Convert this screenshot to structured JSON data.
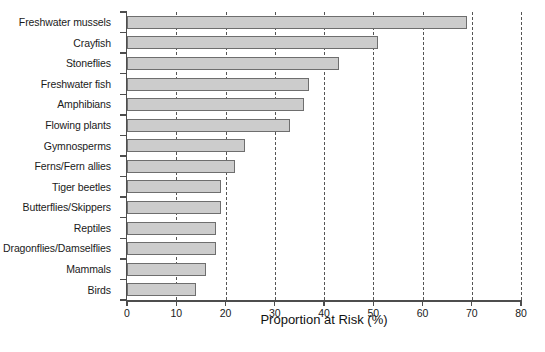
{
  "chart_data": {
    "type": "bar",
    "orientation": "horizontal",
    "title": "",
    "xlabel": "Proportion at Risk (%)",
    "ylabel": "",
    "xlim": [
      0,
      80
    ],
    "xticks": [
      0,
      10,
      20,
      30,
      40,
      50,
      60,
      70,
      80
    ],
    "xtick_labels": [
      "0",
      "10",
      "20",
      "30",
      "40",
      "50",
      "60",
      "70",
      "80"
    ],
    "grid": "vertical-dashed",
    "legend": "none",
    "categories": [
      "Freshwater mussels",
      "Crayfish",
      "Stoneflies",
      "Freshwater fish",
      "Amphibians",
      "Flowing plants",
      "Gymnosperms",
      "Ferns/Fern allies",
      "Tiger beetles",
      "Butterflies/Skippers",
      "Reptiles",
      "Dragonflies/Damselflies",
      "Mammals",
      "Birds"
    ],
    "values": [
      69,
      51,
      43,
      37,
      36,
      33,
      24,
      22,
      19,
      19,
      18,
      18,
      16,
      14
    ],
    "bar_fill_color": "#cccccc",
    "bar_edge_color": "#6e6e6e",
    "axis_color": "#4d4d4d",
    "grid_color": "#555555"
  }
}
